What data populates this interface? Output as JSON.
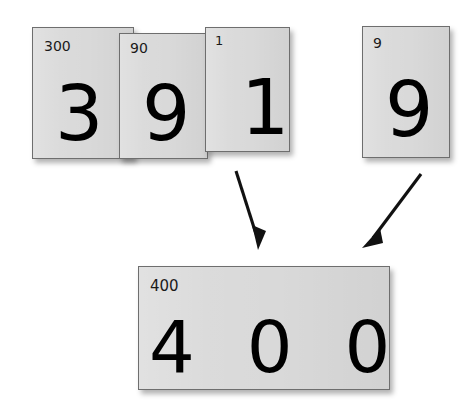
{
  "figure": {
    "type": "place-value-cards-addition",
    "background_color": "#ffffff",
    "card_fill_color": "#d9d9d9",
    "card_border_color": "#6e6e6e",
    "digit_color": "#000000"
  },
  "top_row": {
    "left_group": {
      "cards": [
        {
          "label": "300",
          "digit": "3"
        },
        {
          "label": "90",
          "digit": "9"
        },
        {
          "label": "1",
          "digit": "1"
        }
      ]
    },
    "right_group": {
      "cards": [
        {
          "label": "9",
          "digit": "9"
        }
      ]
    }
  },
  "arrows": [
    {
      "name": "arrow-from-left-group",
      "direction": "down-right"
    },
    {
      "name": "arrow-from-right-group",
      "direction": "down-left"
    }
  ],
  "result": {
    "card": {
      "label": "400",
      "digits": "400"
    }
  }
}
